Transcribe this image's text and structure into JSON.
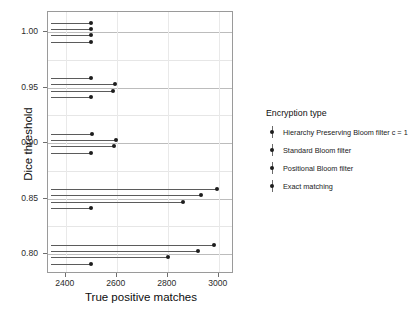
{
  "chart_data": {
    "type": "scatter",
    "plot_style": "lollipop",
    "title": "",
    "xlabel": "True positive matches",
    "ylabel": "Dice threshold",
    "xlim": [
      2330,
      3060
    ],
    "ylim": [
      0.782,
      1.018
    ],
    "xticks": [
      2400,
      2600,
      2800,
      3000
    ],
    "xtick_labels": [
      "2400",
      "2600",
      "2800",
      "3000"
    ],
    "yticks": [
      0.8,
      0.85,
      0.9,
      0.95,
      1.0
    ],
    "ytick_labels": [
      "0.80",
      "0.85",
      "0.90",
      "0.95",
      "1.00"
    ],
    "y_minor_gridlines": [
      0.825,
      0.875,
      0.925,
      0.975
    ],
    "grid": true,
    "legend_position": "right",
    "legend_title": "Encryption type",
    "baseline_x": 2340,
    "categories": [
      "1.00",
      "0.95",
      "0.90",
      "0.85",
      "0.80"
    ],
    "series": [
      {
        "name": "Hierarchy Preserving Bloom filter c = 1",
        "color": "#1d1d1d",
        "values": [
          2500,
          2500,
          2501,
          2995,
          2981
        ]
      },
      {
        "name": "Standard Bloom filter",
        "color": "#1d1d1d",
        "values": [
          2499,
          2594,
          2597,
          2930,
          2918
        ]
      },
      {
        "name": "Positional Bloom filter",
        "color": "#1d1d1d",
        "values": [
          2500,
          2586,
          2588,
          2861,
          2800
        ]
      },
      {
        "name": "Exact matching",
        "color": "#1d1d1d",
        "values": [
          2500,
          2500,
          2500,
          2500,
          2500
        ]
      }
    ],
    "points": [
      {
        "threshold": 1.0,
        "series": "Hierarchy Preserving Bloom filter c = 1",
        "value": 2500
      },
      {
        "threshold": 1.0,
        "series": "Standard Bloom filter",
        "value": 2499
      },
      {
        "threshold": 1.0,
        "series": "Positional Bloom filter",
        "value": 2500
      },
      {
        "threshold": 1.0,
        "series": "Exact matching",
        "value": 2500
      },
      {
        "threshold": 0.95,
        "series": "Hierarchy Preserving Bloom filter c = 1",
        "value": 2500
      },
      {
        "threshold": 0.95,
        "series": "Standard Bloom filter",
        "value": 2594
      },
      {
        "threshold": 0.95,
        "series": "Positional Bloom filter",
        "value": 2586
      },
      {
        "threshold": 0.95,
        "series": "Exact matching",
        "value": 2500
      },
      {
        "threshold": 0.9,
        "series": "Hierarchy Preserving Bloom filter c = 1",
        "value": 2501
      },
      {
        "threshold": 0.9,
        "series": "Standard Bloom filter",
        "value": 2597
      },
      {
        "threshold": 0.9,
        "series": "Positional Bloom filter",
        "value": 2588
      },
      {
        "threshold": 0.9,
        "series": "Exact matching",
        "value": 2500
      },
      {
        "threshold": 0.85,
        "series": "Hierarchy Preserving Bloom filter c = 1",
        "value": 2995
      },
      {
        "threshold": 0.85,
        "series": "Standard Bloom filter",
        "value": 2930
      },
      {
        "threshold": 0.85,
        "series": "Positional Bloom filter",
        "value": 2861
      },
      {
        "threshold": 0.85,
        "series": "Exact matching",
        "value": 2500
      },
      {
        "threshold": 0.8,
        "series": "Hierarchy Preserving Bloom filter c = 1",
        "value": 2981
      },
      {
        "threshold": 0.8,
        "series": "Standard Bloom filter",
        "value": 2918
      },
      {
        "threshold": 0.8,
        "series": "Positional Bloom filter",
        "value": 2800
      },
      {
        "threshold": 0.8,
        "series": "Exact matching",
        "value": 2500
      }
    ]
  },
  "legend": {
    "title": "Encryption type",
    "items": [
      {
        "label": "Hierarchy Preserving Bloom filter c = 1"
      },
      {
        "label": "Standard Bloom filter"
      },
      {
        "label": "Positional Bloom filter"
      },
      {
        "label": "Exact matching"
      }
    ]
  },
  "axes": {
    "x_title": "True positive matches",
    "y_title": "Dice threshold"
  }
}
